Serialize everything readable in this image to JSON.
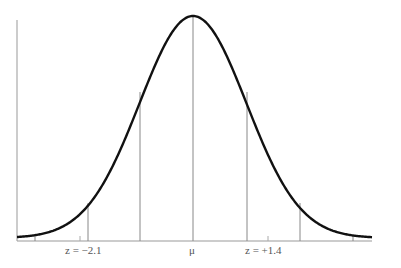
{
  "diagram": {
    "type": "normal-distribution",
    "colors": {
      "curve": "#111111",
      "lines": "#888888",
      "axis": "#999999",
      "label": "#555555"
    },
    "labels": {
      "left_z": "z = −2.1",
      "mean": "μ",
      "right_z": "z = +1.4"
    },
    "z_markers": [
      {
        "name": "z-left",
        "value": -2.1
      },
      {
        "name": "z-right",
        "value": 1.4
      }
    ],
    "sigma_lines": [
      -3,
      -2,
      -1,
      0,
      1,
      2,
      3
    ]
  }
}
